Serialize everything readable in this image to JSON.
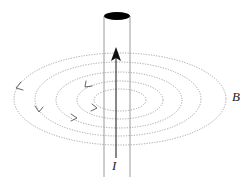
{
  "diagram": {
    "labels": {
      "current": "I",
      "field": "B"
    },
    "wire": {
      "current_direction": "up",
      "field_circulation": "counterclockwise (viewed from above)",
      "field_line_count": 5
    },
    "colors": {
      "wire_outline": "#999999",
      "wire_cap": "#000000",
      "arrow": "#111111",
      "field_lines": "#9a9a9a",
      "text": "#222222",
      "background": "#ffffff"
    }
  }
}
